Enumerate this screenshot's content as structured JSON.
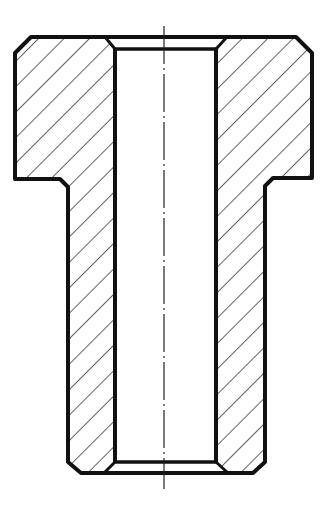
{
  "diagram": {
    "type": "technical-section-drawing",
    "colors": {
      "line": "#111111",
      "background": "#ffffff"
    },
    "centerline_x": 164,
    "parts": [
      "left-flange-section",
      "right-flange-section",
      "left-shank-wall",
      "right-shank-wall",
      "bore",
      "top-chamfer",
      "bottom-chamfer",
      "centerline"
    ]
  }
}
